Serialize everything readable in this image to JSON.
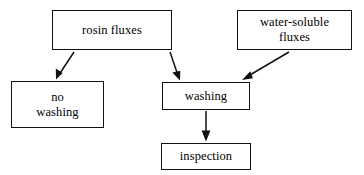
{
  "diagram": {
    "type": "flowchart",
    "background_color": "#ffffff",
    "line_color": "#111111",
    "text_color": "#000000",
    "nodes": [
      {
        "id": "rosin_fluxes",
        "label": "rosin fluxes",
        "x": 52,
        "y": 10,
        "width": 120,
        "height": 40
      },
      {
        "id": "water_soluble",
        "label": "water-soluble\nfluxes",
        "x": 237,
        "y": 10,
        "width": 115,
        "height": 40
      },
      {
        "id": "no_washing",
        "label": "no\nwashing",
        "x": 11,
        "y": 81,
        "width": 93,
        "height": 47
      },
      {
        "id": "washing",
        "label": "washing",
        "x": 162,
        "y": 82,
        "width": 88,
        "height": 28
      },
      {
        "id": "inspection",
        "label": "inspection",
        "x": 161,
        "y": 143,
        "width": 90,
        "height": 27
      }
    ],
    "edges": [
      {
        "id": "rosin-to-no-washing",
        "from": "rosin_fluxes",
        "to": "no_washing",
        "x1": 74,
        "y1": 52,
        "x2": 56,
        "y2": 79
      },
      {
        "id": "rosin-to-washing",
        "from": "rosin_fluxes",
        "to": "washing",
        "x1": 170,
        "y1": 52,
        "x2": 180,
        "y2": 80
      },
      {
        "id": "water-soluble-to-washing",
        "from": "water_soluble",
        "to": "washing",
        "x1": 289,
        "y1": 52,
        "x2": 242,
        "y2": 80
      },
      {
        "id": "washing-to-inspection",
        "from": "washing",
        "to": "inspection",
        "x1": 206,
        "y1": 111,
        "x2": 206,
        "y2": 141
      }
    ]
  }
}
